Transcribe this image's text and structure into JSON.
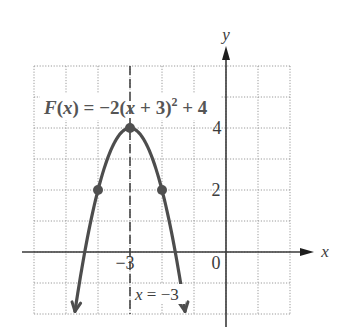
{
  "chart_data": {
    "type": "line",
    "function": {
      "expression": "F(x) = −2(x + 3)^2 + 4",
      "a": -2,
      "h": -3,
      "k": 4
    },
    "xlabel": "x",
    "ylabel": "y",
    "xlim": [
      -6,
      2
    ],
    "ylim": [
      -2,
      6
    ],
    "grid": true,
    "grid_step": 1,
    "x_tick_labels": [
      {
        "value": -3,
        "label": "−3"
      },
      {
        "value": 0,
        "label": "0"
      }
    ],
    "y_tick_labels": [
      {
        "value": 2,
        "label": "2"
      },
      {
        "value": 4,
        "label": "4"
      }
    ],
    "points": [
      {
        "x": -4,
        "y": 2
      },
      {
        "x": -3,
        "y": 4
      },
      {
        "x": -2,
        "y": 2
      }
    ],
    "vertex": {
      "x": -3,
      "y": 4
    },
    "axis_of_symmetry": {
      "x": -3,
      "label": "x = −3"
    },
    "curve_domain": [
      -4.72,
      -1.28
    ],
    "colors": {
      "curve": "#4d4d4d",
      "axes": "#3a3a3a",
      "grid": "#9a9a9a",
      "background": "#ffffff"
    }
  },
  "labels": {
    "x_axis": "x",
    "y_axis": "y",
    "origin": "0",
    "equation": {
      "fname": "F",
      "part1": "(",
      "var1": "x",
      "part2": ") = −2(",
      "var2": "x",
      "part3": " + 3)",
      "exp": "2",
      "part4": " + 4"
    },
    "symmetry": {
      "var": "x",
      "rest": " = −3"
    },
    "tick_x_neg3": "−3",
    "tick_y_2": "2",
    "tick_y_4": "4"
  },
  "layout": {
    "origin_px": [
      226,
      252
    ],
    "unit_x_px": 32,
    "unit_y_px": 31
  }
}
